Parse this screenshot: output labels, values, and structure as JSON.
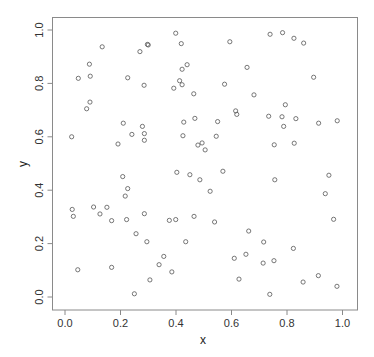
{
  "chart_data": {
    "type": "scatter",
    "title": "",
    "xlabel": "x",
    "ylabel": "y",
    "xlim": [
      -0.04,
      1.04
    ],
    "ylim": [
      -0.05,
      1.05
    ],
    "grid": false,
    "legend": null,
    "x_ticks": [
      0.0,
      0.2,
      0.4,
      0.6,
      0.8,
      1.0
    ],
    "x_tick_labels": [
      "0.0",
      "0.2",
      "0.4",
      "0.6",
      "0.8",
      "1.0"
    ],
    "y_ticks": [
      0.0,
      0.2,
      0.4,
      0.6,
      0.8,
      1.0
    ],
    "y_tick_labels": [
      "0.0",
      "0.2",
      "0.4",
      "0.6",
      "0.8",
      "1.0"
    ],
    "marker": "open-circle",
    "colors": {
      "marker": "#555555",
      "axis": "#8a8a8a",
      "text": "#333333"
    },
    "series": [
      {
        "name": "points",
        "x": [
          0.134,
          0.088,
          0.048,
          0.091,
          0.226,
          0.285,
          0.27,
          0.297,
          0.3,
          0.09,
          0.078,
          0.399,
          0.419,
          0.594,
          0.44,
          0.422,
          0.413,
          0.422,
          0.392,
          0.575,
          0.464,
          0.615,
          0.619,
          0.468,
          0.739,
          0.784,
          0.825,
          0.86,
          0.656,
          0.896,
          0.681,
          0.794,
          0.734,
          0.782,
          0.832,
          0.981,
          0.024,
          0.21,
          0.279,
          0.241,
          0.286,
          0.286,
          0.191,
          0.208,
          0.226,
          0.217,
          0.428,
          0.55,
          0.425,
          0.545,
          0.494,
          0.479,
          0.505,
          0.569,
          0.403,
          0.45,
          0.486,
          0.523,
          0.914,
          0.788,
          0.754,
          0.826,
          0.756,
          0.951,
          0.938,
          0.026,
          0.03,
          0.103,
          0.151,
          0.126,
          0.168,
          0.222,
          0.286,
          0.256,
          0.295,
          0.046,
          0.168,
          0.25,
          0.376,
          0.399,
          0.465,
          0.539,
          0.435,
          0.356,
          0.339,
          0.385,
          0.306,
          0.61,
          0.627,
          0.968,
          0.662,
          0.716,
          0.823,
          0.652,
          0.753,
          0.714,
          0.913,
          0.858,
          0.98,
          0.738
        ],
        "y": [
          0.937,
          0.872,
          0.819,
          0.827,
          0.821,
          0.793,
          0.919,
          0.946,
          0.944,
          0.73,
          0.705,
          0.988,
          0.949,
          0.956,
          0.87,
          0.853,
          0.81,
          0.795,
          0.782,
          0.797,
          0.761,
          0.697,
          0.684,
          0.669,
          0.984,
          0.99,
          0.969,
          0.951,
          0.86,
          0.823,
          0.757,
          0.72,
          0.677,
          0.675,
          0.668,
          0.66,
          0.6,
          0.651,
          0.639,
          0.609,
          0.612,
          0.587,
          0.573,
          0.451,
          0.406,
          0.378,
          0.655,
          0.657,
          0.604,
          0.602,
          0.577,
          0.569,
          0.551,
          0.471,
          0.467,
          0.458,
          0.439,
          0.396,
          0.651,
          0.639,
          0.57,
          0.576,
          0.439,
          0.456,
          0.387,
          0.328,
          0.302,
          0.337,
          0.336,
          0.311,
          0.286,
          0.29,
          0.312,
          0.237,
          0.207,
          0.102,
          0.111,
          0.012,
          0.287,
          0.29,
          0.302,
          0.281,
          0.207,
          0.152,
          0.121,
          0.094,
          0.064,
          0.145,
          0.067,
          0.291,
          0.247,
          0.206,
          0.182,
          0.16,
          0.136,
          0.127,
          0.08,
          0.056,
          0.04,
          0.01
        ]
      }
    ]
  }
}
